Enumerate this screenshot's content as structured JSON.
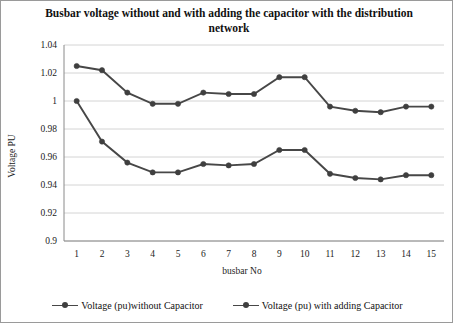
{
  "chart_data": {
    "type": "line",
    "title": "Busbar voltage without and with adding the capacitor with the distribution network",
    "xlabel": "busbar No",
    "ylabel": "Voltage PU",
    "categories": [
      "1",
      "2",
      "3",
      "4",
      "5",
      "6",
      "7",
      "8",
      "9",
      "10",
      "11",
      "12",
      "13",
      "14",
      "15"
    ],
    "x": [
      1,
      2,
      3,
      4,
      5,
      6,
      7,
      8,
      9,
      10,
      11,
      12,
      13,
      14,
      15
    ],
    "ylim": [
      0.9,
      1.04
    ],
    "ytick_labels": [
      "1.04",
      "1.02",
      "1",
      "0.98",
      "0.96",
      "0.94",
      "0.92",
      "0.9"
    ],
    "yticks": [
      1.04,
      1.02,
      1.0,
      0.98,
      0.96,
      0.94,
      0.92,
      0.9
    ],
    "grid": true,
    "legend_position": "bottom",
    "series": [
      {
        "name": "Voltage (pu)without Capacitor",
        "color": "#474747",
        "values": [
          1.0,
          0.971,
          0.956,
          0.949,
          0.949,
          0.955,
          0.954,
          0.955,
          0.965,
          0.965,
          0.948,
          0.945,
          0.944,
          0.947,
          0.947
        ]
      },
      {
        "name": "Voltage (pu) with adding Capacitor",
        "color": "#474747",
        "values": [
          1.025,
          1.022,
          1.006,
          0.998,
          0.998,
          1.006,
          1.005,
          1.005,
          1.017,
          1.017,
          0.996,
          0.993,
          0.992,
          0.996,
          0.996
        ]
      }
    ]
  },
  "legend": {
    "entries": [
      {
        "label": "Voltage (pu)without Capacitor"
      },
      {
        "label": "Voltage (pu) with adding Capacitor"
      }
    ]
  }
}
